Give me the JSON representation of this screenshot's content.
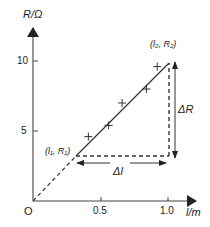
{
  "chart_data": {
    "type": "scatter",
    "title": "",
    "xlabel": "l/m",
    "ylabel": "R/Ω",
    "origin_label": "O",
    "xlim": [
      0,
      1.15
    ],
    "ylim": [
      0,
      12
    ],
    "grid": false,
    "x_ticks": [
      {
        "value": 0.5,
        "label": "0.5"
      },
      {
        "value": 1.0,
        "label": "1.0"
      }
    ],
    "y_ticks": [
      {
        "value": 5,
        "label": "5"
      },
      {
        "value": 10,
        "label": "10"
      }
    ],
    "series": [
      {
        "name": "measurements",
        "marker": "+",
        "points": [
          {
            "x": 0.41,
            "y": 4.6
          },
          {
            "x": 0.56,
            "y": 5.4
          },
          {
            "x": 0.66,
            "y": 7.0
          },
          {
            "x": 0.84,
            "y": 8.0
          },
          {
            "x": 0.92,
            "y": 9.6
          }
        ]
      }
    ],
    "best_fit_line": {
      "solid_from": {
        "x": 0.32,
        "y": 3.2
      },
      "solid_to": {
        "x": 1.0,
        "y": 9.9
      },
      "dashed_extension_to_origin": true
    },
    "annotations": [
      {
        "text": "(l₁, R₁)",
        "point": {
          "x": 0.32,
          "y": 3.2
        }
      },
      {
        "text": "(l₂, R₂)",
        "point": {
          "x": 1.0,
          "y": 9.9
        }
      },
      {
        "text": "ΔR",
        "type": "vertical-double-arrow"
      },
      {
        "text": "Δl",
        "type": "horizontal-double-arrow"
      }
    ]
  },
  "labels": {
    "y_axis": "R/Ω",
    "x_axis": "l/m",
    "origin": "O",
    "x_tick_1": "0.5",
    "x_tick_2": "1.0",
    "y_tick_1": "5",
    "y_tick_2": "10",
    "p1": "(l₁, R₁)",
    "p2": "(l₂, R₂)",
    "delta_r": "ΔR",
    "delta_l": "Δl"
  },
  "colors": {
    "ink": "#222222",
    "background": "#ffffff"
  }
}
